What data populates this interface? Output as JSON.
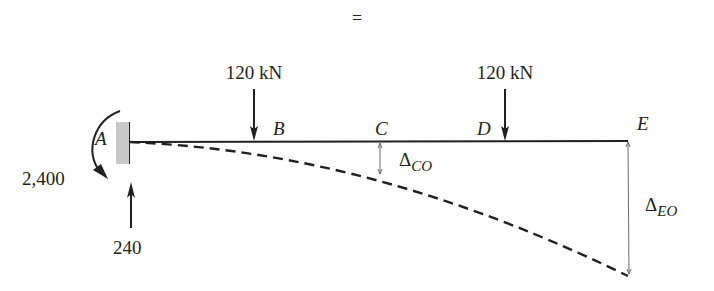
{
  "header": {
    "equals_sign": "="
  },
  "beam": {
    "points": [
      {
        "id": "A",
        "label": "A"
      },
      {
        "id": "B",
        "label": "B"
      },
      {
        "id": "C",
        "label": "C"
      },
      {
        "id": "D",
        "label": "D"
      },
      {
        "id": "E",
        "label": "E"
      }
    ],
    "support": "fixed-wall-at-A"
  },
  "loads": [
    {
      "label": "120 kN",
      "location": "B"
    },
    {
      "label": "120 kN",
      "location": "D"
    }
  ],
  "reactions": {
    "moment_label": "2,400",
    "vertical_label": "240"
  },
  "deflections": {
    "c": {
      "symbol": "Δ",
      "subscript": "CO"
    },
    "e": {
      "symbol": "Δ",
      "subscript": "EO"
    }
  },
  "colors": {
    "ink": "#231f20",
    "wall": "#c8c8c8",
    "dim_line": "#6d6d6d"
  }
}
